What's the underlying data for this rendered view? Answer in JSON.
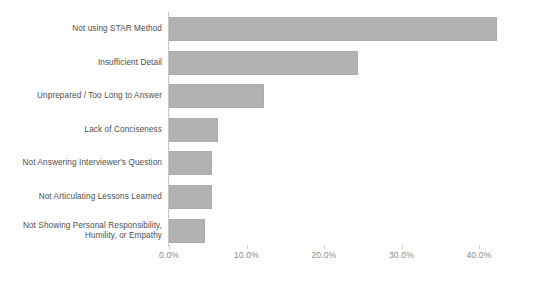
{
  "chart_data": {
    "type": "bar",
    "orientation": "horizontal",
    "title": "",
    "subtitle": "",
    "xlabel": "",
    "ylabel": "",
    "categories": [
      "Not using STAR Method",
      "Insufficient Detail",
      "Unprepared / Too Long to Answer",
      "Lack of Conciseness",
      "Not Answering Interviewer's Question",
      "Not Articulating Lessons Learned",
      "Not Showing Personal Responsibility,\nHumility, or Empathy"
    ],
    "values": [
      42.3,
      24.4,
      12.3,
      6.3,
      5.5,
      5.5,
      4.6
    ],
    "value_unit": "percent",
    "xlim": [
      0,
      42.3
    ],
    "xticks": [
      0,
      10,
      20,
      30,
      40
    ],
    "xtick_labels": [
      "0.0%",
      "10.0%",
      "20.0%",
      "30.0%",
      "40.0%"
    ],
    "grid": false,
    "legend": false,
    "bar_color": "#b2b2b2",
    "axis_color": "#c9c9c9",
    "label_color": "#4f4f4f",
    "tick_label_color": "#8d8d8d"
  }
}
